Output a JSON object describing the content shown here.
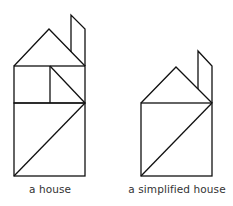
{
  "figure": {
    "stroke_color": "#111111",
    "background": "#ffffff",
    "houses": [
      {
        "id": "house",
        "caption": "a house",
        "shapes": {
          "roof": [
            [
              14,
              66
            ],
            [
              49,
              29
            ],
            [
              85,
              66
            ]
          ],
          "chimney": [
            [
              71,
              66
            ],
            [
              71,
              15
            ],
            [
              85,
              29
            ],
            [
              85,
              66
            ]
          ],
          "upper_box": [
            [
              14,
              66
            ],
            [
              85,
              103
            ]
          ],
          "upper_divider_x": 50,
          "upper_diagonal": [
            [
              50,
              66
            ],
            [
              85,
              103
            ]
          ],
          "lower_box": [
            [
              14,
              103
            ],
            [
              85,
              176
            ]
          ],
          "lower_diagonal": [
            [
              14,
              176
            ],
            [
              85,
              103
            ]
          ]
        }
      },
      {
        "id": "simplified-house",
        "caption": "a simplified house",
        "shapes": {
          "roof": [
            [
              141,
              103
            ],
            [
              176,
              67
            ],
            [
              212,
              103
            ]
          ],
          "chimney": [
            [
              198,
              90
            ],
            [
              198,
              51
            ],
            [
              212,
              66
            ],
            [
              212,
              103
            ]
          ],
          "box": [
            [
              141,
              103
            ],
            [
              212,
              176
            ]
          ],
          "diagonal": [
            [
              141,
              176
            ],
            [
              212,
              103
            ]
          ]
        }
      }
    ]
  }
}
